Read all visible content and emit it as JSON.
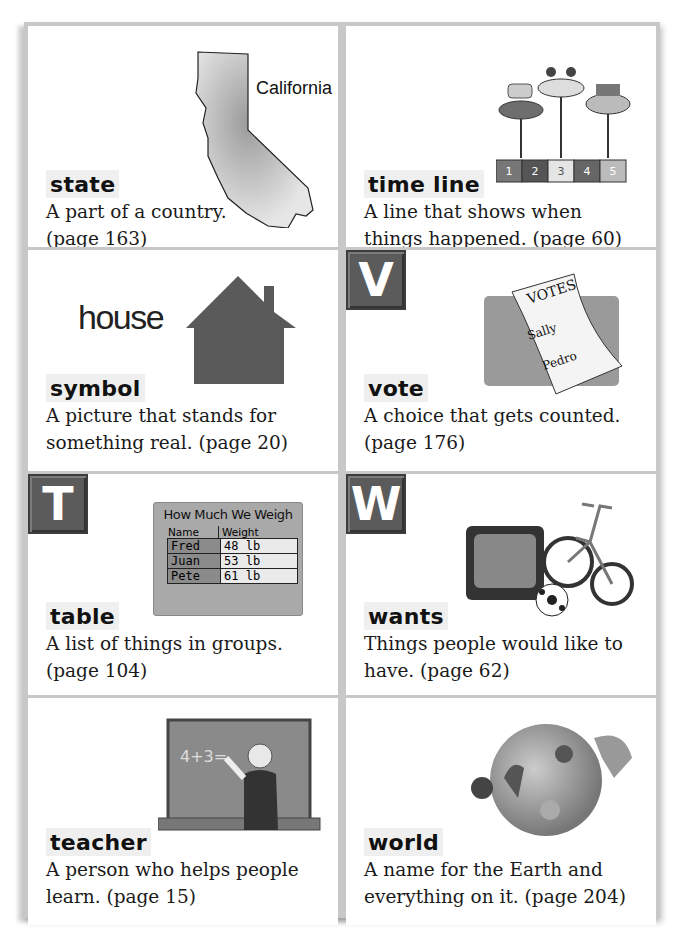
{
  "cards": [
    {
      "term": "state",
      "definition": [
        "A part of a country.",
        "(page 163)"
      ],
      "badge": null,
      "art": {
        "type": "california-map",
        "label": "California"
      }
    },
    {
      "term": "time line",
      "definition": [
        "A line that shows when",
        "things happened. (page 60)"
      ],
      "badge": null,
      "art": {
        "type": "timeline",
        "events": [
          "First shoes",
          "First tricycle",
          "First day of school"
        ],
        "segments": [
          {
            "num": "1",
            "unit": "year"
          },
          {
            "num": "2",
            "unit": "years"
          },
          {
            "num": "3",
            "unit": "years"
          },
          {
            "num": "4",
            "unit": "years"
          },
          {
            "num": "5",
            "unit": "years"
          }
        ]
      }
    },
    {
      "term": "symbol",
      "definition": [
        "A picture that stands for",
        "something real. (page 20)"
      ],
      "badge": null,
      "art": {
        "type": "house",
        "word": "house"
      }
    },
    {
      "term": "vote",
      "definition": [
        "A choice that gets counted.",
        "(page 176)"
      ],
      "badge": "V",
      "art": {
        "type": "ballot",
        "title": "VOTES",
        "names": [
          "Sally",
          "Pedro"
        ]
      }
    },
    {
      "term": "table",
      "definition": [
        "A list of things in groups.",
        "(page 104)"
      ],
      "badge": "T",
      "art": {
        "type": "table",
        "title": "How Much We Weigh",
        "headers": [
          "Name",
          "Weight"
        ],
        "rows": [
          [
            "Fred",
            "48 lb"
          ],
          [
            "Juan",
            "53 lb"
          ],
          [
            "Pete",
            "61 lb"
          ]
        ]
      }
    },
    {
      "term": "wants",
      "definition": [
        "Things people would like to",
        "have. (page 62)"
      ],
      "badge": "W",
      "art": {
        "type": "tv-bike-ball"
      }
    },
    {
      "term": "teacher",
      "definition": [
        "A person who helps people",
        "learn. (page 15)"
      ],
      "badge": null,
      "art": {
        "type": "chalkboard",
        "equation": "4+3="
      }
    },
    {
      "term": "world",
      "definition": [
        "A name for the Earth and",
        "everything on it. (page 204)"
      ],
      "badge": null,
      "art": {
        "type": "globe"
      }
    }
  ],
  "colors": {
    "badge": "#5b5b5b",
    "frame": "#c8c8c8",
    "term_bg": "#efefef"
  }
}
